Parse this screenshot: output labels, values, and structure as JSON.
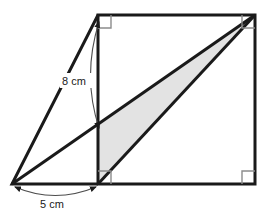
{
  "figure": {
    "kind": "geometry-diagram",
    "background_color": "#ffffff",
    "stroke_color": "#1a1a1a",
    "shade_color": "#e3e3e3",
    "shade_stroke_color": "#9a9a9a",
    "square": {
      "name": "main-square",
      "top_left": [
        98,
        15
      ],
      "top_right": [
        255,
        15
      ],
      "bottom_right": [
        255,
        184
      ],
      "bottom_left": [
        98,
        184
      ],
      "right_angle_markers": 4,
      "right_angle_marker_size": 13
    },
    "left_triangle": {
      "name": "left-triangle",
      "apex": [
        98,
        15
      ],
      "base_left": [
        12,
        184
      ],
      "base_right": [
        98,
        184
      ]
    },
    "diagonals": [
      {
        "name": "long-diagonal",
        "from": [
          12,
          184
        ],
        "to": [
          255,
          15
        ]
      },
      {
        "name": "square-diagonal",
        "from": [
          98,
          184
        ],
        "to": [
          255,
          15
        ]
      }
    ],
    "shaded_triangle": {
      "name": "shaded-triangle",
      "vertices": [
        [
          98,
          125
        ],
        [
          255,
          15
        ],
        [
          98,
          184
        ]
      ]
    },
    "dimensions": [
      {
        "name": "height-dimension",
        "label": "8 cm",
        "label_x": 76,
        "label_y": 82,
        "arc_from": [
          99,
          22
        ],
        "arc_to": [
          99,
          128
        ],
        "arc_bulge_x": 82,
        "orientation": "vertical",
        "measures": "left edge of square"
      },
      {
        "name": "base-dimension",
        "label": "5 cm",
        "label_x": 54,
        "label_y": 206,
        "arc_from": [
          15,
          187
        ],
        "arc_to": [
          96,
          187
        ],
        "arc_bulge_y": 204,
        "orientation": "horizontal",
        "measures": "base extension left of square"
      }
    ]
  }
}
